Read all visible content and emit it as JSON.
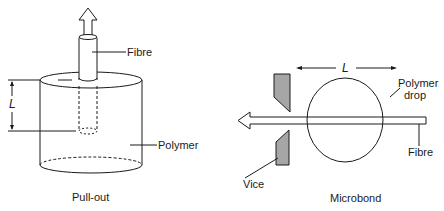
{
  "pullout": {
    "caption": "Pull-out",
    "fibre_label": "Fibre",
    "polymer_label": "Polymer",
    "length_label": "L"
  },
  "microbond": {
    "caption": "Microbond",
    "drop_label_line1": "Polymer",
    "drop_label_line2": "drop",
    "fibre_label": "Fibre",
    "vice_label": "Vice",
    "length_label": "L"
  },
  "colors": {
    "line": "#1a1a1a",
    "vice_fill": "#a6a6a6",
    "background": "#ffffff"
  }
}
